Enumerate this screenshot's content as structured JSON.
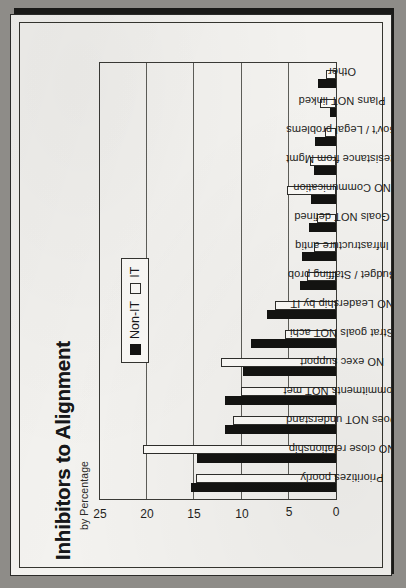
{
  "document": {
    "type": "scanned-page",
    "page_background": "#f3f2ef",
    "border_color": "#2b2b29"
  },
  "chart_data": {
    "type": "bar",
    "orientation": "vertical-rotated-90",
    "title": "Inhibitors to Alignment",
    "subtitle": "by Percentage",
    "xlabel": "",
    "ylabel": "",
    "ylim": [
      0,
      25
    ],
    "yticks": [
      0,
      5,
      10,
      15,
      20,
      25
    ],
    "grid": true,
    "legend_position": "upper-center",
    "colors": {
      "nonit": "#131311",
      "it": "#fbfaf7",
      "outline": "#2e2e2b"
    },
    "categories": [
      "Prioritizes poorly",
      "NO close relationship",
      "Does NOT understand",
      "Commitments NOT met",
      "NO exec support",
      "Strat goals NOT achi",
      "NO Leadership by IT",
      "Budget / Staffing prob",
      "Infrastructure antiq",
      "Goals NOT defined",
      "NO Communication",
      "Resistance from Mgmt",
      "Gov't / Legal problems",
      "Plans NOT linked",
      "Other"
    ],
    "series": [
      {
        "name": "Non-IT",
        "values": [
          15.2,
          14.6,
          11.7,
          11.7,
          9.8,
          8.9,
          7.2,
          3.8,
          3.6,
          2.8,
          2.6,
          2.3,
          2.2,
          0.6,
          1.9
        ]
      },
      {
        "name": "IT",
        "values": [
          14.7,
          20.3,
          10.8,
          10.0,
          12.1,
          5.4,
          6.4,
          3.1,
          2.3,
          2.0,
          5.1,
          2.7,
          1.2,
          1.7,
          1.1
        ]
      }
    ]
  },
  "legend": {
    "entries": [
      {
        "label": "Non-IT",
        "swatch": "filled-black"
      },
      {
        "label": "IT",
        "swatch": "outlined-white"
      }
    ]
  }
}
